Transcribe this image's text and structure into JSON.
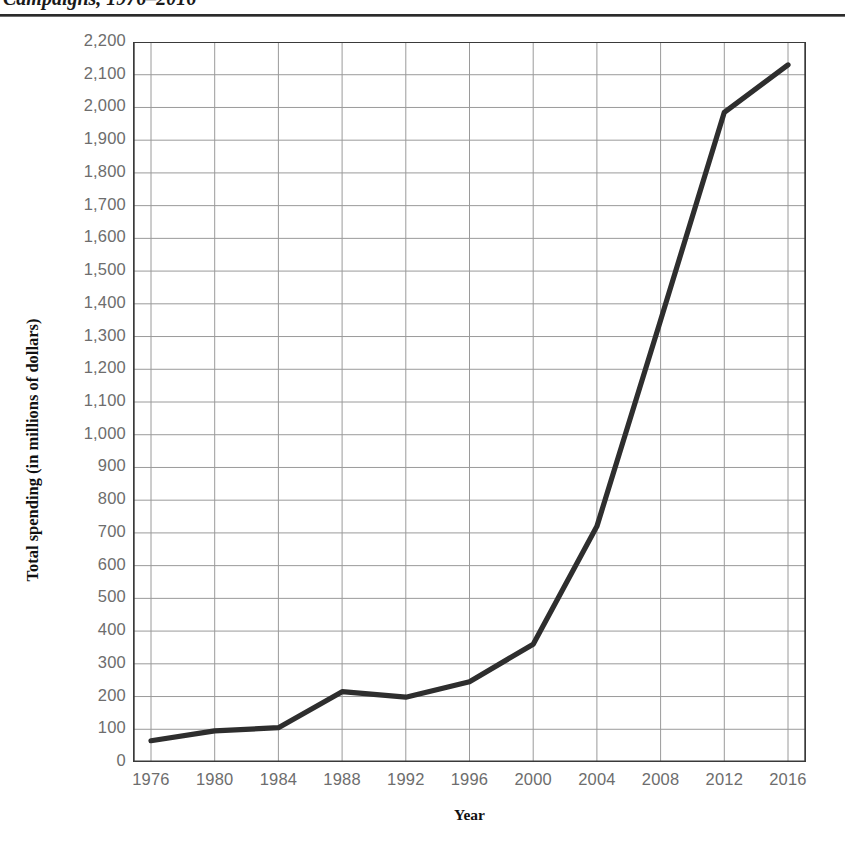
{
  "caption": {
    "text": "Campaigns, 1976–2016"
  },
  "chart_data": {
    "type": "line",
    "title": "",
    "xlabel": "Year",
    "ylabel": "Total spending (in millions of dollars)",
    "categories": [
      1976,
      1980,
      1984,
      1988,
      1992,
      1996,
      2000,
      2004,
      2008,
      2012,
      2016
    ],
    "x_tick_labels": [
      "1976",
      "1980",
      "1984",
      "1988",
      "1992",
      "1996",
      "2000",
      "2004",
      "2008",
      "2012",
      "2016"
    ],
    "values": [
      65,
      95,
      105,
      215,
      198,
      245,
      360,
      720,
      1350,
      1985,
      2130
    ],
    "y_tick_labels": [
      "2,200",
      "2,100",
      "2,000",
      "1,900",
      "1,800",
      "1,700",
      "1,600",
      "1,500",
      "1,400",
      "1,300",
      "1,200",
      "1,100",
      "1,000",
      "900",
      "800",
      "700",
      "600",
      "500",
      "400",
      "300",
      "200",
      "100",
      "0"
    ],
    "y_tick_values": [
      2200,
      2100,
      2000,
      1900,
      1800,
      1700,
      1600,
      1500,
      1400,
      1300,
      1200,
      1100,
      1000,
      900,
      800,
      700,
      600,
      500,
      400,
      300,
      200,
      100,
      0
    ],
    "ylim": [
      0,
      2200
    ],
    "xlim": [
      1974,
      2018
    ],
    "grid": true,
    "legend": "none",
    "series": [
      {
        "name": "Total spending",
        "values": [
          65,
          95,
          105,
          215,
          198,
          245,
          360,
          720,
          1350,
          1985,
          2130
        ]
      }
    ],
    "line_color": "#2e2e2e",
    "grid_color": "#9a9a9a",
    "axis_color": "#3a3a3a",
    "tick_label_color": "#6d6d6d"
  }
}
